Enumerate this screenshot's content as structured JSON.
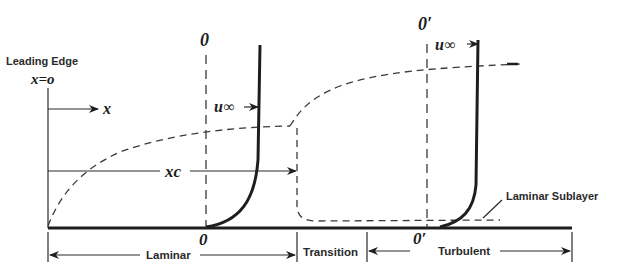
{
  "diagram": {
    "labels": {
      "leading_edge": "Leading Edge",
      "x_origin": "x=o",
      "x_axis": "x",
      "station_o_top": "0",
      "station_o_bottom": "0",
      "station_o_prime_top": "0′",
      "station_o_prime_bottom": "0′",
      "u_inf_laminar": "u∞",
      "u_inf_turbulent": "u∞",
      "x_critical": "xc",
      "laminar_sublayer": "Laminar Sublayer"
    },
    "regions": [
      {
        "name": "Laminar"
      },
      {
        "name": "Transition"
      },
      {
        "name": "Turbulent"
      }
    ],
    "colors": {
      "ink": "#1e1e1e",
      "background": "#ffffff"
    }
  }
}
